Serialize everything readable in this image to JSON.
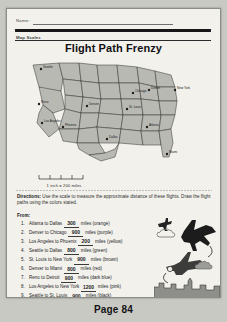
{
  "header": {
    "name_label": "Name:",
    "section_label": "Map Scales",
    "title": "Flight Path Frenzy"
  },
  "map": {
    "scale_text": "1 inch = 200 miles",
    "cities": [
      {
        "name": "Seattle",
        "x": 22,
        "y": 12
      },
      {
        "name": "Reno",
        "x": 20,
        "y": 47
      },
      {
        "name": "Los Angeles",
        "x": 23,
        "y": 66
      },
      {
        "name": "Phoenix",
        "x": 44,
        "y": 70
      },
      {
        "name": "Denver",
        "x": 68,
        "y": 49
      },
      {
        "name": "Dallas",
        "x": 88,
        "y": 82
      },
      {
        "name": "St. Louis",
        "x": 108,
        "y": 52
      },
      {
        "name": "Chicago",
        "x": 114,
        "y": 36
      },
      {
        "name": "Detroit",
        "x": 130,
        "y": 33
      },
      {
        "name": "Atlanta",
        "x": 128,
        "y": 70
      },
      {
        "name": "Miami",
        "x": 148,
        "y": 97
      },
      {
        "name": "New York",
        "x": 156,
        "y": 33
      }
    ]
  },
  "directions": {
    "bold": "Directions:",
    "text": " Use the scale to measure the approximate distance of these flights. Draw the flight paths using the colors stated.",
    "from_label": "From:"
  },
  "flights": [
    {
      "n": "1.",
      "route": "Atlanta to Dallas",
      "answer": "300",
      "unit": "miles",
      "color": "(orange)"
    },
    {
      "n": "2.",
      "route": "Denver to Chicago",
      "answer": "900",
      "unit": "miles",
      "color": "(purple)"
    },
    {
      "n": "3.",
      "route": "Los Angeles to Phoenix",
      "answer": "200",
      "unit": "miles",
      "color": "(yellow)"
    },
    {
      "n": "4.",
      "route": "Seattle to Dallas",
      "answer": "800",
      "unit": "miles",
      "color": "(green)"
    },
    {
      "n": "5.",
      "route": "St. Louis to New York",
      "answer": "900",
      "unit": "miles",
      "color": "(brown)"
    },
    {
      "n": "6.",
      "route": "Denver to Miami",
      "answer": "800",
      "unit": "miles",
      "color": "(red)"
    },
    {
      "n": "7.",
      "route": "Reno to Detroit",
      "answer": "900",
      "unit": "miles",
      "color": "(dark blue)"
    },
    {
      "n": "8.",
      "route": "Los Angeles to New York",
      "answer": "1200",
      "unit": "miles",
      "color": "(pink)"
    },
    {
      "n": "9.",
      "route": "Seattle to St. Louis",
      "answer": "900",
      "unit": "miles",
      "color": "(black)"
    },
    {
      "n": "10.",
      "route": "Chicago to Miami",
      "answer": "600",
      "unit": "miles",
      "color": "(light blue)"
    }
  ],
  "footer": {
    "copyright": "© 2010 Teacher Education. All Rights Reserved.",
    "page_number": "Page 84"
  },
  "colors": {
    "ink": "#17171a",
    "paper": "#f2f1ec",
    "map_fill": "#b9b9b4",
    "backdrop": "#c9c9c4"
  }
}
